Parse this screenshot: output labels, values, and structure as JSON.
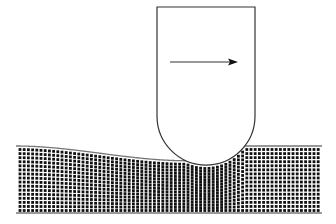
{
  "diagram": {
    "description": "Rigid rounded indenter sliding right across a deformable lattice of particles",
    "colors": {
      "background": "#ffffff",
      "stroke": "#333333",
      "particle": "#111111",
      "surface_line": "#777777"
    },
    "indenter": {
      "left": 157,
      "right": 255,
      "top": 7,
      "arc_center_y": 116,
      "radius": 49
    },
    "motion_arrow": {
      "x1": 170,
      "x2": 238,
      "y": 62,
      "direction": "right"
    },
    "substrate": {
      "left": 16,
      "right": 322,
      "top": 146,
      "bottom": 213,
      "dot_spacing_x": 4.2,
      "dot_spacing_y": 4.2,
      "dot_radius": 1.4
    }
  }
}
